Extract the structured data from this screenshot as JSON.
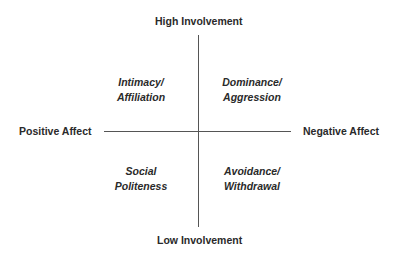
{
  "axes": {
    "top": "High Involvement",
    "bottom": "Low Involvement",
    "left": "Positive Affect",
    "right": "Negative Affect"
  },
  "quadrants": {
    "top_left": [
      "Intimacy/",
      "Affiliation"
    ],
    "top_right": [
      "Dominance/",
      "Aggression"
    ],
    "bottom_left": [
      "Social",
      "Politeness"
    ],
    "bottom_right": [
      "Avoidance/",
      "Withdrawal"
    ]
  }
}
